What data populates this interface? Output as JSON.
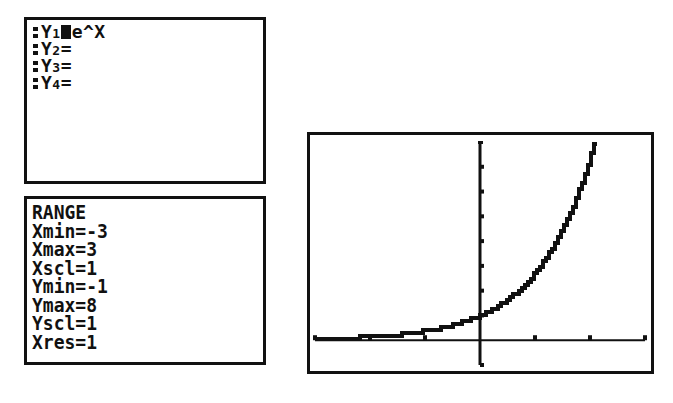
{
  "y_editor": {
    "functions": [
      {
        "label": "Y1",
        "name": "Y",
        "sub": "1",
        "expr": "e^X",
        "selected": true
      },
      {
        "label": "Y2",
        "name": "Y",
        "sub": "2",
        "expr": "",
        "selected": false
      },
      {
        "label": "Y3",
        "name": "Y",
        "sub": "3",
        "expr": "",
        "selected": false
      },
      {
        "label": "Y4",
        "name": "Y",
        "sub": "4",
        "expr": "",
        "selected": false
      }
    ]
  },
  "range": {
    "title": "RANGE",
    "lines": [
      "Xmin=-3",
      "Xmax=3",
      "Xscl=1",
      "Ymin=-1",
      "Ymax=8",
      "Yscl=1",
      "Xres=1"
    ],
    "Xmin": -3,
    "Xmax": 3,
    "Xscl": 1,
    "Ymin": -1,
    "Ymax": 8,
    "Yscl": 1,
    "Xres": 1
  },
  "graph": {
    "function": "e^X",
    "xlim": [
      -3,
      3
    ],
    "ylim": [
      -1,
      8
    ],
    "x_ticks": [
      -3,
      -2,
      -1,
      1,
      2,
      3
    ],
    "y_ticks": [
      -1,
      1,
      2,
      3,
      4,
      5,
      6,
      7
    ],
    "line_color": "#111111",
    "background": "#ffffff"
  }
}
